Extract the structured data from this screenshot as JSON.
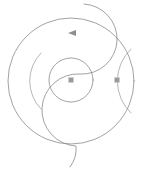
{
  "figure": {
    "title": "Geometric circle diagram",
    "description": "Outer circle divided by an S-shaped curve, with an inner circle, a right-hand lens region, a left crescent arc and three small markers",
    "background_color": "#ffffff",
    "stroke_color": "#8a8a8a",
    "marker_color": "#9a9a9a",
    "canvas": {
      "width": 145,
      "height": 171
    }
  },
  "shapes": {
    "outer_circle": {
      "name": "outer-circle",
      "center_x": 71,
      "center_y": 81,
      "radius": 63
    },
    "inner_circle": {
      "name": "inner-circle",
      "center_x": 71,
      "center_y": 80,
      "radius": 22
    },
    "s_curve": {
      "name": "s-divider-curve",
      "upper_arc_radius": 33,
      "lower_arc_radius": 33,
      "start_x": 84,
      "start_y": 4,
      "end_x": 70,
      "end_y": 167
    },
    "left_crescent": {
      "name": "left-crescent-arc",
      "center_x": 62,
      "center_y": 81,
      "radius": 40,
      "start_angle_deg": 145,
      "end_angle_deg": 215
    },
    "right_lens": {
      "name": "right-lens-region",
      "left_x": 100,
      "right_x": 133,
      "top_y": 48,
      "bottom_y": 114
    }
  },
  "markers": [
    {
      "name": "center-square-marker",
      "glyph": "square-marker",
      "x": 71,
      "y": 80,
      "size": 5
    },
    {
      "name": "lens-square-marker",
      "glyph": "square-marker",
      "x": 117,
      "y": 80,
      "size": 5
    },
    {
      "name": "top-arrow-marker",
      "glyph": "arrow-left-marker",
      "x": 72,
      "y": 33,
      "size": 6
    }
  ]
}
